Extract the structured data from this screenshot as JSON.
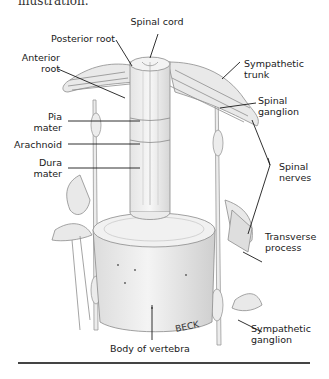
{
  "page": {
    "caption_tail": "illustration."
  },
  "figure": {
    "signature": "BECK",
    "labels": {
      "spinal_cord": "Spinal cord",
      "posterior_root": "Posterior root",
      "anterior_root_l1": "Anterior",
      "anterior_root_l2": "root",
      "sympathetic_trunk_l1": "Sympathetic",
      "sympathetic_trunk_l2": "trunk",
      "spinal_ganglion_l1": "Spinal",
      "spinal_ganglion_l2": "ganglion",
      "pia_mater_l1": "Pia",
      "pia_mater_l2": "mater",
      "arachnoid": "Arachnoid",
      "dura_mater_l1": "Dura",
      "dura_mater_l2": "mater",
      "spinal_nerves_l1": "Spinal",
      "spinal_nerves_l2": "nerves",
      "transverse_process_l1": "Transverse",
      "transverse_process_l2": "process",
      "sympathetic_ganglion_l1": "Sympathetic",
      "sympathetic_ganglion_l2": "ganglion",
      "body_of_vertebra": "Body of vertebra"
    }
  }
}
